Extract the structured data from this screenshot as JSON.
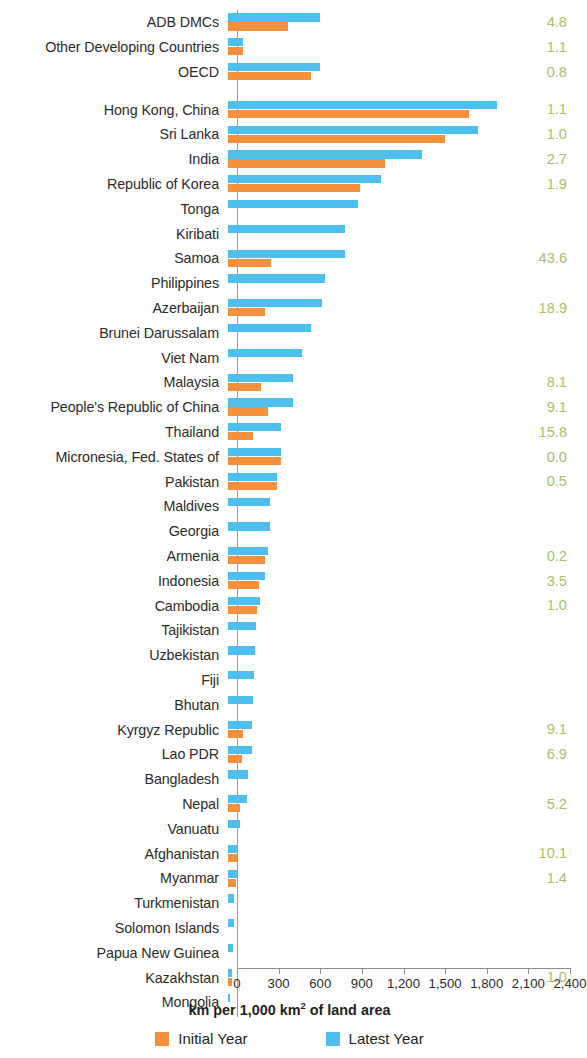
{
  "chart_data": {
    "type": "bar",
    "orientation": "horizontal",
    "title": "",
    "xlabel": "km per 1,000 km² of land area",
    "ylabel": "",
    "xlim": [
      0,
      2400
    ],
    "xticks": [
      0,
      300,
      600,
      900,
      1200,
      1500,
      1800,
      2100,
      2400
    ],
    "xtick_labels": [
      "0",
      "300",
      "600",
      "900",
      "1,200",
      "1,500",
      "1,800",
      "2,100",
      "2,400"
    ],
    "grid": false,
    "legend_position": "bottom",
    "colors": {
      "initial_year": "#f5903c",
      "latest_year": "#4dc0f0",
      "value_label": "#a9c06a"
    },
    "series": [
      {
        "name": "Initial Year",
        "color": "#f5903c"
      },
      {
        "name": "Latest Year",
        "color": "#4dc0f0"
      }
    ],
    "categories": [
      "ADB DMCs",
      "Other Developing Countries",
      "OECD",
      "Hong Kong, China",
      "Sri Lanka",
      "India",
      "Republic of Korea",
      "Tonga",
      "Kiribati",
      "Samoa",
      "Philippines",
      "Azerbaijan",
      "Brunei Darussalam",
      "Viet Nam",
      "Malaysia",
      "People's Republic of China",
      "Thailand",
      "Micronesia, Fed. States of",
      "Pakistan",
      "Maldives",
      "Georgia",
      "Armenia",
      "Indonesia",
      "Cambodia",
      "Tajikistan",
      "Uzbekistan",
      "Fiji",
      "Bhutan",
      "Kyrgyz Republic",
      "Lao PDR",
      "Bangladesh",
      "Nepal",
      "Vanuatu",
      "Afghanistan",
      "Myanmar",
      "Turkmenistan",
      "Solomon Islands",
      "Papua New Guinea",
      "Kazakhstan",
      "Mongolia"
    ],
    "rows": [
      {
        "category": "ADB DMCs",
        "latest": 660,
        "initial": 430,
        "value_label": "4.8",
        "group_break": false
      },
      {
        "category": "Other Developing Countries",
        "latest": 110,
        "initial": 105,
        "value_label": "1.1",
        "group_break": false
      },
      {
        "category": "OECD",
        "latest": 660,
        "initial": 600,
        "value_label": "0.8",
        "group_break": false
      },
      {
        "category": "Hong Kong, China",
        "latest": 1940,
        "initial": 1740,
        "value_label": "1.1",
        "group_break": true
      },
      {
        "category": "Sri Lanka",
        "latest": 1800,
        "initial": 1565,
        "value_label": "1.0",
        "group_break": false
      },
      {
        "category": "India",
        "latest": 1400,
        "initial": 1135,
        "value_label": "2.7",
        "group_break": false
      },
      {
        "category": "Republic of Korea",
        "latest": 1105,
        "initial": 950,
        "value_label": "1.9",
        "group_break": false
      },
      {
        "category": "Tonga",
        "latest": 940,
        "initial": 0,
        "value_label": "",
        "group_break": false
      },
      {
        "category": "Kiribati",
        "latest": 845,
        "initial": 0,
        "value_label": "",
        "group_break": false
      },
      {
        "category": "Samoa",
        "latest": 845,
        "initial": 310,
        "value_label": "43.6",
        "group_break": false
      },
      {
        "category": "Philippines",
        "latest": 700,
        "initial": 0,
        "value_label": "",
        "group_break": false
      },
      {
        "category": "Azerbaijan",
        "latest": 680,
        "initial": 265,
        "value_label": "18.9",
        "group_break": false
      },
      {
        "category": "Brunei Darussalam",
        "latest": 600,
        "initial": 0,
        "value_label": "",
        "group_break": false
      },
      {
        "category": "Viet Nam",
        "latest": 530,
        "initial": 0,
        "value_label": "",
        "group_break": false
      },
      {
        "category": "Malaysia",
        "latest": 470,
        "initial": 240,
        "value_label": "8.1",
        "group_break": false
      },
      {
        "category": "People's Republic of China",
        "latest": 470,
        "initial": 290,
        "value_label": "9.1",
        "group_break": false
      },
      {
        "category": "Thailand",
        "latest": 380,
        "initial": 180,
        "value_label": "15.8",
        "group_break": false
      },
      {
        "category": "Micronesia, Fed. States of",
        "latest": 380,
        "initial": 380,
        "value_label": "0.0",
        "group_break": false
      },
      {
        "category": "Pakistan",
        "latest": 355,
        "initial": 350,
        "value_label": "0.5",
        "group_break": false
      },
      {
        "category": "Maldives",
        "latest": 300,
        "initial": 0,
        "value_label": "",
        "group_break": false
      },
      {
        "category": "Georgia",
        "latest": 300,
        "initial": 0,
        "value_label": "",
        "group_break": false
      },
      {
        "category": "Armenia",
        "latest": 285,
        "initial": 270,
        "value_label": "0.2",
        "group_break": false
      },
      {
        "category": "Indonesia",
        "latest": 265,
        "initial": 220,
        "value_label": "3.5",
        "group_break": false
      },
      {
        "category": "Cambodia",
        "latest": 230,
        "initial": 210,
        "value_label": "1.0",
        "group_break": false
      },
      {
        "category": "Tajikistan",
        "latest": 205,
        "initial": 0,
        "value_label": "",
        "group_break": false
      },
      {
        "category": "Uzbekistan",
        "latest": 195,
        "initial": 0,
        "value_label": "",
        "group_break": false
      },
      {
        "category": "Fiji",
        "latest": 190,
        "initial": 0,
        "value_label": "",
        "group_break": false
      },
      {
        "category": "Bhutan",
        "latest": 180,
        "initial": 0,
        "value_label": "",
        "group_break": false
      },
      {
        "category": "Kyrgyz Republic",
        "latest": 175,
        "initial": 105,
        "value_label": "9.1",
        "group_break": false
      },
      {
        "category": "Lao PDR",
        "latest": 170,
        "initial": 100,
        "value_label": "6.9",
        "group_break": false
      },
      {
        "category": "Bangladesh",
        "latest": 145,
        "initial": 0,
        "value_label": "",
        "group_break": false
      },
      {
        "category": "Nepal",
        "latest": 140,
        "initial": 90,
        "value_label": "5.2",
        "group_break": false
      },
      {
        "category": "Vanuatu",
        "latest": 85,
        "initial": 0,
        "value_label": "",
        "group_break": false
      },
      {
        "category": "Afghanistan",
        "latest": 75,
        "initial": 65,
        "value_label": "10.1",
        "group_break": false
      },
      {
        "category": "Myanmar",
        "latest": 70,
        "initial": 60,
        "value_label": "1.4",
        "group_break": false
      },
      {
        "category": "Turkmenistan",
        "latest": 45,
        "initial": 0,
        "value_label": "",
        "group_break": false
      },
      {
        "category": "Solomon Islands",
        "latest": 40,
        "initial": 0,
        "value_label": "",
        "group_break": false
      },
      {
        "category": "Papua New Guinea",
        "latest": 35,
        "initial": 0,
        "value_label": "",
        "group_break": false
      },
      {
        "category": "Kazakhstan",
        "latest": 30,
        "initial": 28,
        "value_label": "1.0",
        "group_break": false
      },
      {
        "category": "Mongolia",
        "latest": 18,
        "initial": 0,
        "value_label": "",
        "group_break": false
      }
    ]
  },
  "legend": {
    "items": [
      {
        "label": "Initial Year",
        "color": "#f5903c",
        "swatch_name": "legend-swatch-initial-year"
      },
      {
        "label": "Latest Year",
        "color": "#4dc0f0",
        "swatch_name": "legend-swatch-latest-year"
      }
    ]
  },
  "axis": {
    "title_prefix": "km per 1,000 km",
    "title_sup": "2",
    "title_suffix": " of land area"
  }
}
